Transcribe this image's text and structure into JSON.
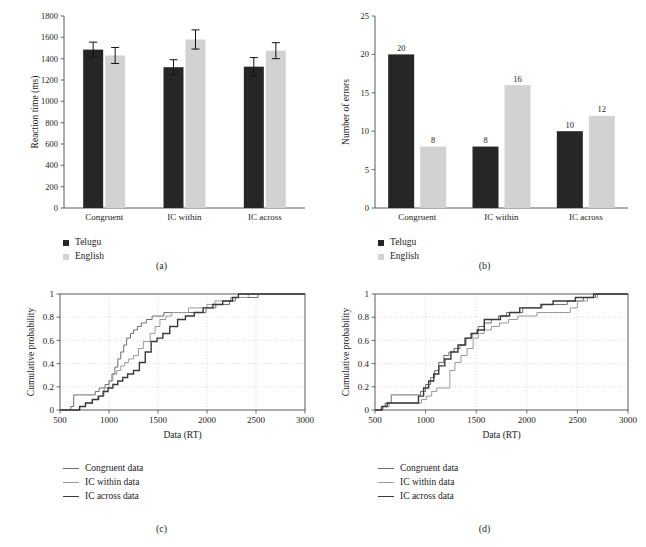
{
  "figure": {
    "panels": [
      "a",
      "b",
      "c",
      "d"
    ],
    "captions": {
      "a": "(a)",
      "b": "(b)",
      "c": "(c)",
      "d": "(d)"
    }
  },
  "colors": {
    "telugu_dark": "#262626",
    "english_light": "#d2d2d2",
    "axis": "#4a4a4a",
    "grid": "#b9b9b9",
    "congruent_line": "#6e6e6e",
    "ic_within_line": "#9a9a9a",
    "ic_across_line": "#3a3a3a"
  },
  "legend_groups": {
    "bars": [
      {
        "label": "Telugu",
        "swatch": "#262626",
        "icon": "filled-square-swatch"
      },
      {
        "label": "English",
        "swatch": "#d2d2d2",
        "icon": "filled-square-swatch"
      }
    ],
    "cdf": [
      {
        "label": "Congruent data",
        "color": "#6e6e6e",
        "width": 1.0,
        "icon": "line-swatch"
      },
      {
        "label": "IC within data",
        "color": "#9a9a9a",
        "width": 1.0,
        "icon": "line-swatch"
      },
      {
        "label": "IC across data",
        "color": "#3a3a3a",
        "width": 1.4,
        "icon": "line-swatch"
      }
    ]
  },
  "chart_data": [
    {
      "panel": "a",
      "type": "bar",
      "title": "",
      "xlabel": "",
      "ylabel": "Reaction time (ms)",
      "ylim": [
        0,
        1800
      ],
      "yticks": [
        0,
        200,
        400,
        600,
        800,
        1000,
        1200,
        1400,
        1600,
        1800
      ],
      "ytick_labels": [
        "0",
        "200",
        "400",
        "600",
        "800",
        "1000",
        "1200",
        "1400",
        "1600",
        "1800"
      ],
      "categories": [
        "Congruent",
        "IC within",
        "IC across"
      ],
      "grid": false,
      "legend_position": "below-left",
      "series": [
        {
          "name": "Telugu",
          "color": "#262626",
          "values": [
            1485,
            1320,
            1325
          ],
          "errors": [
            70,
            70,
            85
          ]
        },
        {
          "name": "English",
          "color": "#d2d2d2",
          "values": [
            1430,
            1580,
            1475
          ],
          "errors": [
            75,
            90,
            75
          ]
        }
      ]
    },
    {
      "panel": "b",
      "type": "bar",
      "title": "",
      "xlabel": "",
      "ylabel": "Number of errors",
      "ylim": [
        0,
        25
      ],
      "yticks": [
        0,
        5,
        10,
        15,
        20,
        25
      ],
      "ytick_labels": [
        "0",
        "5",
        "10",
        "15",
        "20",
        "25"
      ],
      "categories": [
        "Congruent",
        "IC within",
        "IC across"
      ],
      "grid": false,
      "data_labels": true,
      "legend_position": "below-left",
      "series": [
        {
          "name": "Telugu",
          "color": "#262626",
          "values": [
            20,
            8,
            10
          ],
          "value_labels": [
            "20",
            "8",
            "10"
          ]
        },
        {
          "name": "English",
          "color": "#d2d2d2",
          "values": [
            8,
            16,
            12
          ],
          "value_labels": [
            "8",
            "16",
            "12"
          ]
        }
      ]
    },
    {
      "panel": "c",
      "type": "line",
      "subtype": "empirical-cdf-step",
      "title": "",
      "xlabel": "Data (RT)",
      "ylabel": "Cumulative probability",
      "xlim": [
        500,
        3000
      ],
      "ylim": [
        0,
        1
      ],
      "xticks": [
        500,
        1000,
        1500,
        2000,
        2500,
        3000
      ],
      "xtick_labels": [
        "500",
        "1000",
        "1500",
        "2000",
        "2500",
        "3000"
      ],
      "yticks": [
        0,
        0.2,
        0.4,
        0.6,
        0.8,
        1
      ],
      "ytick_labels": [
        "0",
        "0.2",
        "0.4",
        "0.6",
        "0.8",
        "1"
      ],
      "grid": true,
      "legend_position": "below-left",
      "series": [
        {
          "name": "Congruent data",
          "color": "#6e6e6e",
          "width": 1.0,
          "x": [
            610,
            640,
            700,
            760,
            860,
            900,
            960,
            1000,
            1030,
            1060,
            1090,
            1120,
            1150,
            1180,
            1220,
            1250,
            1290,
            1330,
            1380,
            1440,
            1500,
            1560,
            1620,
            1700,
            1790,
            1880,
            1990,
            2090,
            2160,
            2230,
            2290,
            2360,
            2520
          ],
          "y": [
            0.03,
            0.13,
            0.13,
            0.13,
            0.16,
            0.19,
            0.22,
            0.25,
            0.31,
            0.37,
            0.44,
            0.5,
            0.56,
            0.62,
            0.66,
            0.69,
            0.72,
            0.75,
            0.78,
            0.81,
            0.81,
            0.84,
            0.84,
            0.84,
            0.84,
            0.84,
            0.88,
            0.91,
            0.91,
            0.94,
            0.97,
            0.97,
            1.0
          ]
        },
        {
          "name": "IC within data",
          "color": "#9a9a9a",
          "width": 1.0,
          "x": [
            700,
            760,
            830,
            900,
            950,
            1000,
            1040,
            1080,
            1120,
            1160,
            1200,
            1250,
            1300,
            1350,
            1420,
            1470,
            1520,
            1580,
            1640,
            1720,
            1810,
            1900,
            2000,
            2080,
            2150,
            2240,
            2330,
            2420
          ],
          "y": [
            0.03,
            0.06,
            0.09,
            0.12,
            0.19,
            0.25,
            0.31,
            0.34,
            0.38,
            0.41,
            0.44,
            0.47,
            0.53,
            0.59,
            0.66,
            0.72,
            0.78,
            0.81,
            0.84,
            0.84,
            0.88,
            0.88,
            0.91,
            0.94,
            0.94,
            0.97,
            0.97,
            1.0
          ]
        },
        {
          "name": "IC across data",
          "color": "#3a3a3a",
          "width": 1.4,
          "x": [
            700,
            760,
            830,
            890,
            940,
            990,
            1040,
            1090,
            1140,
            1190,
            1250,
            1310,
            1370,
            1430,
            1490,
            1550,
            1620,
            1700,
            1780,
            1870,
            1960,
            2060,
            2160,
            2260,
            2320
          ],
          "y": [
            0.03,
            0.06,
            0.09,
            0.12,
            0.16,
            0.19,
            0.22,
            0.25,
            0.28,
            0.31,
            0.34,
            0.41,
            0.5,
            0.59,
            0.62,
            0.66,
            0.72,
            0.78,
            0.81,
            0.84,
            0.88,
            0.91,
            0.94,
            0.97,
            1.0
          ]
        }
      ]
    },
    {
      "panel": "d",
      "type": "line",
      "subtype": "empirical-cdf-step",
      "title": "",
      "xlabel": "Data (RT)",
      "ylabel": "Cumulative probability",
      "xlim": [
        500,
        3000
      ],
      "ylim": [
        0,
        1
      ],
      "xticks": [
        500,
        1000,
        1500,
        2000,
        2500,
        3000
      ],
      "xtick_labels": [
        "500",
        "1000",
        "1500",
        "2000",
        "2500",
        "3000"
      ],
      "yticks": [
        0,
        0.2,
        0.4,
        0.6,
        0.8,
        1
      ],
      "ytick_labels": [
        "0",
        "0.2",
        "0.4",
        "0.6",
        "0.8",
        "1"
      ],
      "grid": true,
      "legend_position": "below-left",
      "series": [
        {
          "name": "Congruent data",
          "color": "#6e6e6e",
          "width": 1.0,
          "x": [
            560,
            600,
            660,
            720,
            950,
            1000,
            1050,
            1090,
            1130,
            1180,
            1230,
            1280,
            1340,
            1400,
            1460,
            1520,
            1580,
            1650,
            1720,
            1800,
            1880,
            1960,
            2050,
            2150,
            2260,
            2400,
            2500,
            2560,
            2620,
            2680,
            2790
          ],
          "y": [
            0.03,
            0.06,
            0.13,
            0.13,
            0.16,
            0.22,
            0.28,
            0.34,
            0.41,
            0.47,
            0.5,
            0.53,
            0.56,
            0.62,
            0.66,
            0.72,
            0.75,
            0.78,
            0.81,
            0.84,
            0.84,
            0.88,
            0.88,
            0.91,
            0.91,
            0.94,
            0.94,
            0.97,
            0.97,
            1.0,
            1.0
          ]
        },
        {
          "name": "IC within data",
          "color": "#9a9a9a",
          "width": 1.0,
          "x": [
            580,
            640,
            900,
            960,
            1010,
            1060,
            1110,
            1170,
            1220,
            1240,
            1290,
            1350,
            1410,
            1470,
            1520,
            1580,
            1650,
            1730,
            1820,
            1910,
            2000,
            2100,
            2200,
            2310,
            2430,
            2500,
            2600,
            2700
          ],
          "y": [
            0.03,
            0.06,
            0.06,
            0.09,
            0.12,
            0.16,
            0.19,
            0.19,
            0.19,
            0.34,
            0.41,
            0.47,
            0.53,
            0.62,
            0.66,
            0.69,
            0.72,
            0.75,
            0.78,
            0.81,
            0.81,
            0.84,
            0.84,
            0.84,
            0.88,
            0.94,
            0.97,
            1.0
          ]
        },
        {
          "name": "IC across data",
          "color": "#3a3a3a",
          "width": 1.4,
          "x": [
            570,
            620,
            680,
            740,
            880,
            930,
            980,
            1030,
            1080,
            1130,
            1190,
            1250,
            1320,
            1390,
            1450,
            1510,
            1580,
            1660,
            1740,
            1830,
            1930,
            2030,
            2140,
            2260,
            2380,
            2480,
            2570,
            2660,
            2760
          ],
          "y": [
            0.03,
            0.06,
            0.06,
            0.06,
            0.06,
            0.12,
            0.19,
            0.25,
            0.31,
            0.38,
            0.44,
            0.5,
            0.56,
            0.62,
            0.66,
            0.69,
            0.78,
            0.78,
            0.81,
            0.84,
            0.88,
            0.88,
            0.91,
            0.94,
            0.94,
            0.97,
            0.97,
            1.0,
            1.0
          ]
        }
      ]
    }
  ],
  "bottom_partial_text": {
    "text": ""
  }
}
